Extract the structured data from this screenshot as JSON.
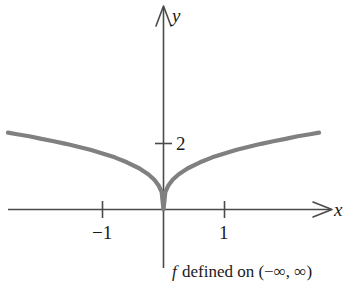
{
  "figure": {
    "title": "",
    "caption": {
      "function_symbol": "f",
      "text": " defined on (−∞, ∞)",
      "full": "f defined on (−∞, ∞)"
    },
    "axis_labels": {
      "x": "x",
      "y": "y"
    },
    "tick_labels": {
      "x_neg1": "−1",
      "x_pos1": "1",
      "y_2": "2"
    },
    "colors": {
      "curve": "#808080",
      "axis": "#4a4a4a",
      "text": "#1a1a1a",
      "background": "#ffffff"
    }
  },
  "chart_data": {
    "type": "line",
    "title": "",
    "subtitle": "",
    "xlabel": "x",
    "ylabel": "y",
    "xlim": [
      -2.55,
      2.75
    ],
    "ylim": [
      -0.55,
      3.3
    ],
    "grid": false,
    "legend": null,
    "annotations": [
      "f defined on (−∞, ∞)"
    ],
    "xticks": [
      -1,
      1
    ],
    "xticklabels": [
      "−1",
      "1"
    ],
    "yticks": [
      2
    ],
    "yticklabels": [
      "2"
    ],
    "series": [
      {
        "name": "f(x)",
        "description": "even cusp function, f(x) = 1.7 * |x|^(1/3), sharp cusp at origin",
        "x": [
          -2.55,
          -2.4,
          -2.2,
          -2.0,
          -1.8,
          -1.6,
          -1.4,
          -1.2,
          -1.0,
          -0.8,
          -0.6,
          -0.4,
          -0.25,
          -0.15,
          -0.08,
          -0.03,
          0,
          0.03,
          0.08,
          0.15,
          0.25,
          0.4,
          0.6,
          0.8,
          1.0,
          1.2,
          1.4,
          1.6,
          1.8,
          2.0,
          2.2,
          2.4,
          2.55
        ],
        "y": [
          2.33,
          2.28,
          2.22,
          2.14,
          2.07,
          1.99,
          1.9,
          1.81,
          1.7,
          1.58,
          1.43,
          1.25,
          1.07,
          0.9,
          0.73,
          0.53,
          0,
          0.53,
          0.73,
          0.9,
          1.07,
          1.25,
          1.43,
          1.58,
          1.7,
          1.81,
          1.9,
          1.99,
          2.07,
          2.14,
          2.22,
          2.28,
          2.33
        ]
      }
    ]
  }
}
